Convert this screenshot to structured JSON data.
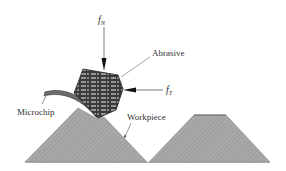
{
  "diagram": {
    "labels": {
      "normal_force": {
        "symbol": "f",
        "subscript": "N"
      },
      "tangential_force": {
        "symbol": "f",
        "subscript": "T"
      },
      "abrasive": "Abrasive",
      "microchip": "Microchip",
      "workpiece": "Workpiece"
    },
    "colors": {
      "workpiece_fill": "#a9a9a9",
      "workpiece_hatch": "#8a8a8a",
      "abrasive_dark": "#3a3a3a",
      "abrasive_light": "#f2f2f2",
      "chip_fill": "#6b6b6b",
      "line": "#444444",
      "arrow": "#111111",
      "text": "#333333"
    }
  }
}
